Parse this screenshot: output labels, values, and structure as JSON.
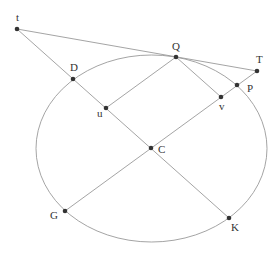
{
  "diagram": {
    "ellipse": {
      "cx": 151.5,
      "cy": 148.5,
      "rx": 115.5,
      "ry": 93.5,
      "stroke": "#a0a0a0"
    },
    "points": [
      {
        "name": "t",
        "label": "t",
        "x": 17,
        "y": 29,
        "lx": 16,
        "ly": 21
      },
      {
        "name": "D",
        "label": "D",
        "x": 73,
        "y": 79,
        "lx": 70,
        "ly": 71
      },
      {
        "name": "u",
        "label": "u",
        "x": 106,
        "y": 108,
        "lx": 97,
        "ly": 117
      },
      {
        "name": "C",
        "label": "C",
        "x": 151,
        "y": 148,
        "lx": 158,
        "ly": 153
      },
      {
        "name": "K",
        "label": "K",
        "x": 229,
        "y": 218,
        "lx": 231,
        "ly": 231
      },
      {
        "name": "G",
        "label": "G",
        "x": 65,
        "y": 211,
        "lx": 50,
        "ly": 219
      },
      {
        "name": "Q",
        "label": "Q",
        "x": 176,
        "y": 57,
        "lx": 172,
        "ly": 50
      },
      {
        "name": "v",
        "label": "v",
        "x": 221,
        "y": 97,
        "lx": 219,
        "ly": 110
      },
      {
        "name": "P",
        "label": "P",
        "x": 237,
        "y": 85,
        "lx": 247,
        "ly": 92
      },
      {
        "name": "T",
        "label": "T",
        "x": 257,
        "y": 71,
        "lx": 256,
        "ly": 63
      }
    ],
    "segments": [
      {
        "from": "t",
        "to": "K"
      },
      {
        "from": "t",
        "to": "T"
      },
      {
        "from": "G",
        "to": "T"
      },
      {
        "from": "Q",
        "to": "u"
      },
      {
        "from": "Q",
        "to": "v"
      }
    ],
    "line_color": "#9a9a9a",
    "point_color": "#333333"
  }
}
